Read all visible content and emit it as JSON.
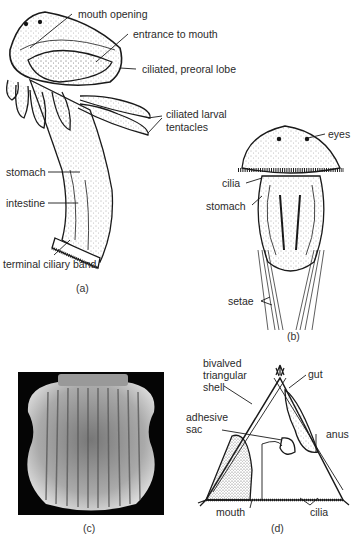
{
  "panels": {
    "a": {
      "caption": "(a)",
      "labels": {
        "mouth_opening": "mouth opening",
        "entrance_to_mouth": "entrance to mouth",
        "preoral_lobe": "ciliated, preoral lobe",
        "tentacles_line1": "ciliated larval",
        "tentacles_line2": "tentacles",
        "stomach": "stomach",
        "intestine": "intestine",
        "ciliary_band": "terminal ciliary band"
      }
    },
    "b": {
      "caption": "(b)",
      "labels": {
        "eyes": "eyes",
        "cilia": "cilia",
        "stomach": "stomach",
        "setae": "setae"
      }
    },
    "c": {
      "caption": "(c)"
    },
    "d": {
      "caption": "(d)",
      "labels": {
        "shell_line1": "bivalved",
        "shell_line2": "triangular",
        "shell_line3": "shell",
        "gut": "gut",
        "adhesive_line1": "adhesive",
        "adhesive_line2": "sac",
        "anus": "anus",
        "mouth": "mouth",
        "cilia": "cilia"
      }
    }
  },
  "colors": {
    "ink": "#1a1a1a",
    "paper": "#ffffff",
    "photo_bg": "#050505"
  }
}
